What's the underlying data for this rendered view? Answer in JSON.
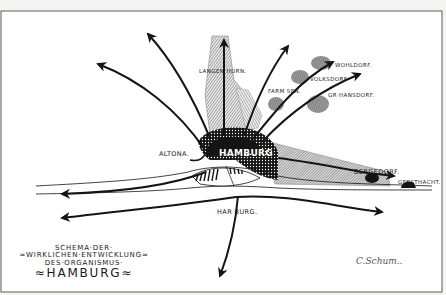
{
  "diagram": {
    "type": "urban development axis scheme",
    "title_lines": [
      "SCHEMA·DER·",
      "≈WIRKLICHEN·ENTWICKLUNG≈",
      "DES·ORGANISMUS·",
      "≈HAMBURG≈"
    ],
    "signature": "C.Schum..",
    "center": {
      "label": "HAMBURG"
    },
    "places": [
      {
        "id": "langenhorn",
        "label": "LANGEN HORN.",
        "x": 200,
        "y": 69
      },
      {
        "id": "wohldorf",
        "label": "WOHLDORF.",
        "x": 335,
        "y": 63
      },
      {
        "id": "volksdorf",
        "label": "VOLKSDORF",
        "x": 310,
        "y": 77
      },
      {
        "id": "farmsen",
        "label": "FARM SEN.",
        "x": 268,
        "y": 89
      },
      {
        "id": "gr-hansdorf",
        "label": "GR·HANSDORF.",
        "x": 328,
        "y": 93
      },
      {
        "id": "altona",
        "label": "ALTONA.",
        "x": 160,
        "y": 151
      },
      {
        "id": "bergedorf",
        "label": "BERGEDORF.",
        "x": 355,
        "y": 170
      },
      {
        "id": "geesthacht",
        "label": "GEESTHACHT.",
        "x": 398,
        "y": 180
      },
      {
        "id": "harburg",
        "label": "HAR BURG.",
        "x": 218,
        "y": 209
      }
    ],
    "axes": [
      "west-northwest",
      "northwest",
      "north (Langenhorn)",
      "north-northeast",
      "northeast (Wohldorf / Volksdorf)",
      "east-northeast (Gr. Hansdorf)",
      "east (Bergedorf / Geesthacht)",
      "west along Elbe (north bank)",
      "west along Elbe (south bank)",
      "east along Elbe (south bank)",
      "south (from Harburg)"
    ],
    "colors": {
      "ink": "#141414",
      "paper": "#f4f4f2",
      "frame": "#5a5a5a",
      "hatch_gray": "#8a8a8a"
    }
  }
}
